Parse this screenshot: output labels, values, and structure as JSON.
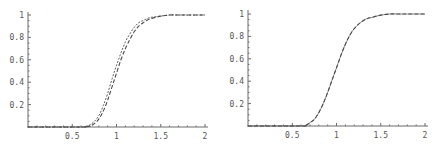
{
  "chart_data": [
    {
      "type": "line",
      "title": "",
      "xlabel": "",
      "ylabel": "",
      "xlim": [
        0,
        2
      ],
      "ylim": [
        0,
        1
      ],
      "grid": false,
      "legend": null,
      "x_ticks": [
        "0.5",
        "1",
        "1.5",
        "2"
      ],
      "y_ticks": [
        "0.2",
        "0.4",
        "0.6",
        "0.8",
        "1"
      ],
      "x": [
        0.0,
        0.6,
        0.65,
        0.7,
        0.75,
        0.8,
        0.85,
        0.9,
        0.95,
        1.0,
        1.05,
        1.1,
        1.15,
        1.2,
        1.25,
        1.3,
        1.35,
        1.4,
        1.5,
        1.6,
        1.7,
        1.8,
        2.0
      ],
      "series": [
        {
          "name": "curve-1 (fine dashed)",
          "style": "dashed-fine",
          "values": [
            0,
            0,
            0.005,
            0.02,
            0.05,
            0.1,
            0.19,
            0.3,
            0.43,
            0.55,
            0.66,
            0.76,
            0.83,
            0.89,
            0.93,
            0.95,
            0.97,
            0.98,
            0.99,
            1.0,
            1.0,
            1.0,
            1.0
          ]
        },
        {
          "name": "curve-2 (long dashed)",
          "style": "dashed-long",
          "values": [
            0,
            0,
            0.003,
            0.01,
            0.03,
            0.07,
            0.14,
            0.24,
            0.36,
            0.48,
            0.6,
            0.7,
            0.78,
            0.85,
            0.9,
            0.93,
            0.955,
            0.97,
            0.99,
            1.0,
            1.0,
            1.0,
            1.0
          ]
        }
      ]
    },
    {
      "type": "line",
      "title": "",
      "xlabel": "",
      "ylabel": "",
      "xlim": [
        0,
        2
      ],
      "ylim": [
        0,
        1
      ],
      "grid": false,
      "legend": null,
      "x_ticks": [
        "0.5",
        "1",
        "1.5",
        "2"
      ],
      "y_ticks": [
        "0.2",
        "0.4",
        "0.6",
        "0.8",
        "1"
      ],
      "x": [
        0.0,
        0.6,
        0.65,
        0.7,
        0.75,
        0.8,
        0.85,
        0.9,
        0.95,
        1.0,
        1.05,
        1.1,
        1.15,
        1.2,
        1.25,
        1.3,
        1.35,
        1.4,
        1.5,
        1.6,
        1.7,
        1.8,
        2.0
      ],
      "series": [
        {
          "name": "curve-1 (solid)",
          "style": "solid-thin",
          "values": [
            0,
            0,
            0.005,
            0.03,
            0.06,
            0.12,
            0.2,
            0.3,
            0.41,
            0.52,
            0.63,
            0.73,
            0.81,
            0.87,
            0.91,
            0.94,
            0.96,
            0.97,
            0.99,
            1.0,
            1.0,
            1.0,
            1.0
          ]
        },
        {
          "name": "curve-2 (dashed)",
          "style": "dashed-long",
          "values": [
            0,
            0,
            0.005,
            0.03,
            0.06,
            0.12,
            0.2,
            0.3,
            0.41,
            0.52,
            0.63,
            0.73,
            0.81,
            0.87,
            0.91,
            0.94,
            0.96,
            0.97,
            0.99,
            1.0,
            1.0,
            1.0,
            1.0
          ]
        }
      ]
    }
  ],
  "colors": {
    "axis": "#6a6a6a",
    "curve": "#4a4a4a",
    "label": "#555555",
    "background": "#ffffff"
  }
}
